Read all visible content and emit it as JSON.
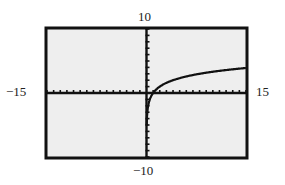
{
  "chart_data": {
    "type": "line",
    "title": "",
    "xlabel": "",
    "ylabel": "",
    "xlim": [
      -15,
      15
    ],
    "ylim": [
      -10,
      10
    ],
    "xscl": 1,
    "yscl": 1,
    "grid": false,
    "legend": null,
    "window_labels": {
      "xmin": "−15",
      "xmax": "15",
      "ymin": "−10",
      "ymax": "10"
    },
    "series": [
      {
        "name": "y = log2(x)",
        "x": [
          0.05,
          0.1,
          0.25,
          0.5,
          1,
          2,
          3,
          4,
          5,
          6,
          8,
          10,
          12,
          15
        ],
        "y": [
          -4.32,
          -3.32,
          -2.0,
          -1.0,
          0,
          1.0,
          1.58,
          2.0,
          2.32,
          2.58,
          3.0,
          3.32,
          3.58,
          3.91
        ]
      }
    ]
  },
  "colors": {
    "page_background": "#ffffff",
    "plot_background": "#eeeeee",
    "frame": "#111111",
    "axis": "#111111",
    "curve": "#111111"
  }
}
